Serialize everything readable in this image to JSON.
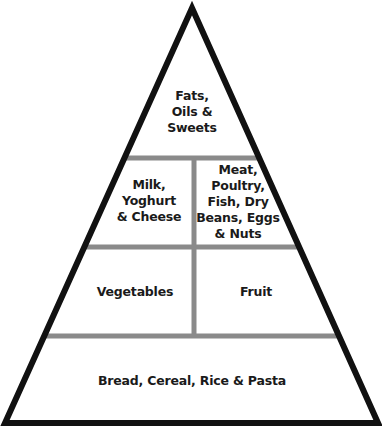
{
  "diagram": {
    "type": "food-pyramid",
    "colors": {
      "outline": "#111111",
      "divider": "#8a8a8a",
      "background": "#ffffff",
      "text": "#1a1a1a"
    },
    "tiers": [
      {
        "level": 1,
        "sections": [
          {
            "id": "fats",
            "label": "Fats,\nOils &\nSweets"
          }
        ]
      },
      {
        "level": 2,
        "sections": [
          {
            "id": "dairy",
            "label": "Milk,\nYoghurt\n& Cheese"
          },
          {
            "id": "protein",
            "label": "Meat,\nPoultry,\nFish, Dry\nBeans, Eggs\n& Nuts"
          }
        ]
      },
      {
        "level": 3,
        "sections": [
          {
            "id": "vegetables",
            "label": "Vegetables"
          },
          {
            "id": "fruit",
            "label": "Fruit"
          }
        ]
      },
      {
        "level": 4,
        "sections": [
          {
            "id": "grains",
            "label": "Bread, Cereal, Rice & Pasta"
          }
        ]
      }
    ]
  }
}
